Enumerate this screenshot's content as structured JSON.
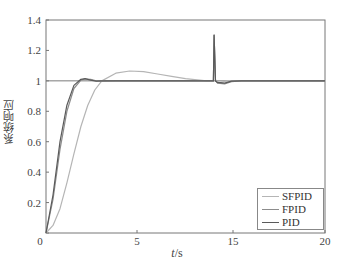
{
  "chart_data": {
    "type": "line",
    "title": "",
    "xlabel": "t/s",
    "ylabel": "系统响应",
    "xlim": [
      0,
      20
    ],
    "ylim": [
      0,
      1.4
    ],
    "grid": false,
    "legend_position": "lower right",
    "x_tick_labels": [
      "0",
      "5",
      "15",
      "20"
    ],
    "y_tick_labels": [
      "0",
      "0.2",
      "0.4",
      "0.6",
      "0.8",
      "1",
      "1.2",
      "1.4"
    ],
    "series": [
      {
        "name": "SFPID",
        "color": "#b5b5b5",
        "x": [
          0,
          0.5,
          1,
          1.5,
          2,
          2.5,
          3,
          3.5,
          4,
          5,
          6,
          7,
          8,
          9,
          10,
          11,
          11.5,
          12,
          12.05,
          12.15,
          12.3,
          13,
          14,
          16,
          18,
          20
        ],
        "y": [
          0,
          0.05,
          0.16,
          0.33,
          0.52,
          0.7,
          0.84,
          0.94,
          1.0,
          1.05,
          1.065,
          1.06,
          1.045,
          1.03,
          1.015,
          1.005,
          1.0,
          1.0,
          1.3,
          1.0,
          0.985,
          1.0,
          1.0,
          1.0,
          1.0,
          1.0
        ]
      },
      {
        "name": "FPID",
        "color": "#8c8c8c",
        "x": [
          0,
          0.5,
          1,
          1.5,
          2,
          2.5,
          2.8,
          3.2,
          3.6,
          4,
          5,
          8,
          11,
          12,
          12.05,
          12.15,
          12.3,
          12.8,
          13.3,
          14,
          16,
          20
        ],
        "y": [
          0,
          0.22,
          0.55,
          0.8,
          0.95,
          1.005,
          1.012,
          1.01,
          1.0,
          0.998,
          1.0,
          1.0,
          1.0,
          1.0,
          1.3,
          1.0,
          0.985,
          0.98,
          0.995,
          1.0,
          1.0,
          1.0
        ]
      },
      {
        "name": "PID",
        "color": "#5a5a5a",
        "x": [
          0,
          0.5,
          1,
          1.5,
          2,
          2.5,
          2.8,
          3.2,
          3.6,
          4,
          5,
          8,
          11,
          12,
          12.05,
          12.15,
          12.3,
          12.8,
          13.3,
          14,
          16,
          20
        ],
        "y": [
          0,
          0.25,
          0.6,
          0.84,
          0.97,
          1.01,
          1.015,
          1.005,
          0.998,
          1.0,
          1.0,
          1.0,
          1.0,
          1.0,
          1.3,
          1.0,
          0.99,
          0.985,
          0.998,
          1.0,
          1.0,
          1.0
        ]
      }
    ],
    "reference_line": {
      "y": 1.0,
      "color": "#7a7a7a"
    }
  },
  "axes": {
    "x_title_italic": "t",
    "x_title_rest": "/s",
    "y_title": "系统响应",
    "x_ticks": [
      {
        "label": "5",
        "px": 137
      },
      {
        "label": "15",
        "px": 233
      },
      {
        "label": "20",
        "px": 325
      }
    ],
    "y_ticks": [
      {
        "label": "0",
        "value": 0
      },
      {
        "label": "0.2",
        "value": 0.2
      },
      {
        "label": "0.4",
        "value": 0.4
      },
      {
        "label": "0.6",
        "value": 0.6
      },
      {
        "label": "0.8",
        "value": 0.8
      },
      {
        "label": "1",
        "value": 1.0
      },
      {
        "label": "1.2",
        "value": 1.2
      },
      {
        "label": "1.4",
        "value": 1.4
      }
    ]
  },
  "legend": {
    "items": [
      {
        "label": "SFPID",
        "color": "#b5b5b5"
      },
      {
        "label": "FPID",
        "color": "#8c8c8c"
      },
      {
        "label": "PID",
        "color": "#5a5a5a"
      }
    ]
  }
}
